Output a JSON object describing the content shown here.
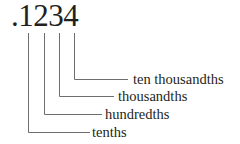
{
  "diagram": {
    "number": ".1234",
    "line_color": "#6d6e71",
    "text_color": "#231f20",
    "place_values": [
      {
        "digit": "1",
        "label": "tenths"
      },
      {
        "digit": "2",
        "label": "hundredths"
      },
      {
        "digit": "3",
        "label": "thousandths"
      },
      {
        "digit": "4",
        "label": "ten thousandths"
      }
    ]
  }
}
